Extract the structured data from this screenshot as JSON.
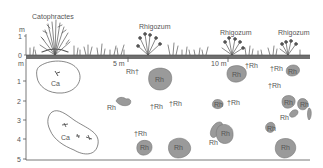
{
  "figure": {
    "type": "soil-profile-transect",
    "above_ground": {
      "y_axis_unit": "m",
      "y_ticks": [
        "1",
        "0"
      ],
      "species_labels": [
        {
          "name": "Catophractes",
          "x": 32,
          "y": 13
        },
        {
          "name": "Rhigozum",
          "x": 139,
          "y": 23
        },
        {
          "name": "Rhigozum",
          "x": 220,
          "y": 29
        },
        {
          "name": "Rhigozum",
          "x": 278,
          "y": 29
        }
      ]
    },
    "below_ground": {
      "y_axis_unit": "m",
      "y_ticks": [
        "1",
        "2",
        "3",
        "4",
        "5"
      ],
      "distance_markers": [
        "5 m",
        "10 m"
      ]
    },
    "patches": [
      {
        "label": "Ca",
        "kind": "outline"
      },
      {
        "label": "Ca",
        "kind": "outline"
      }
    ],
    "root_labels": {
      "alive": "Rh",
      "dead": "†Rh",
      "dead_suffix": "Rh†"
    },
    "annotations": [
      {
        "text": "Rh†",
        "x": 126,
        "y": 70
      },
      {
        "text": "Rh",
        "x": 154,
        "y": 80
      },
      {
        "text": "Rh",
        "x": 108,
        "y": 104
      },
      {
        "text": "†Rh",
        "x": 148,
        "y": 105
      },
      {
        "text": "†Rh",
        "x": 167,
        "y": 102
      },
      {
        "text": "Rh",
        "x": 236,
        "y": 74
      },
      {
        "text": "†Rh",
        "x": 244,
        "y": 62
      },
      {
        "text": "†Rh",
        "x": 271,
        "y": 63
      },
      {
        "text": "Rh",
        "x": 294,
        "y": 69
      },
      {
        "text": "†Rh",
        "x": 267,
        "y": 81
      },
      {
        "text": "Rh",
        "x": 218,
        "y": 106
      },
      {
        "text": "†Rh",
        "x": 228,
        "y": 102
      },
      {
        "text": "Rh",
        "x": 285,
        "y": 102
      },
      {
        "text": "Rh",
        "x": 304,
        "y": 104
      },
      {
        "text": "Rh",
        "x": 282,
        "y": 116
      },
      {
        "text": "Rh",
        "x": 268,
        "y": 127
      },
      {
        "text": "Rh",
        "x": 220,
        "y": 133
      },
      {
        "text": "Rh",
        "x": 209,
        "y": 141
      },
      {
        "text": "†Rh",
        "x": 134,
        "y": 134
      },
      {
        "text": "Rh",
        "x": 143,
        "y": 148
      },
      {
        "text": "Rh",
        "x": 178,
        "y": 146
      },
      {
        "text": "Rh",
        "x": 288,
        "y": 146
      },
      {
        "text": "Ca",
        "x": 51,
        "y": 82
      },
      {
        "text": "Ca",
        "x": 61,
        "y": 138
      }
    ],
    "colors": {
      "root_fill": "#9a9a9a",
      "root_stroke": "#777777",
      "ground_band": "#6f6f6f",
      "axis": "#555555",
      "outline": "#555555"
    }
  }
}
